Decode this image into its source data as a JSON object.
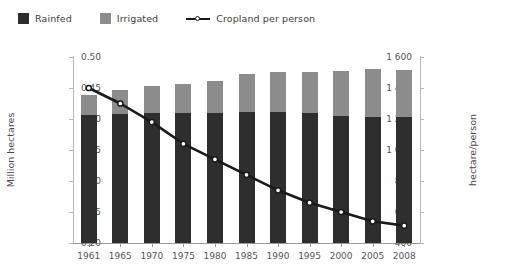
{
  "legend": {
    "items": [
      {
        "label": "Rainfed",
        "marker": "square-swatch",
        "color": "#2e2e2e"
      },
      {
        "label": "Irrigated",
        "marker": "square-swatch",
        "color": "#8c8c8c"
      },
      {
        "label": "Cropland per person",
        "marker": "line-with-point",
        "color": "#1a1a1a"
      }
    ]
  },
  "chart_data": {
    "type": "bar",
    "title": "",
    "subtitle": "",
    "xlabel": "",
    "ylabel": "Million hectares",
    "y2label": "hectare/person",
    "categories": [
      "1961",
      "1965",
      "1970",
      "1975",
      "1980",
      "1985",
      "1990",
      "1995",
      "2000",
      "2005",
      "2008"
    ],
    "ylim": [
      400,
      1600
    ],
    "yticks": [
      "400",
      "600",
      "800",
      "1 000",
      "1 200",
      "1 400",
      "1 600"
    ],
    "ytick_values": [
      400,
      600,
      800,
      1000,
      1200,
      1400,
      1600
    ],
    "y2lim": [
      0.2,
      0.5
    ],
    "y2ticks": [
      "0.20",
      "0.25",
      "0.30",
      "0.35",
      "0.40",
      "0.45",
      "0.50"
    ],
    "y2tick_values": [
      0.2,
      0.25,
      0.3,
      0.35,
      0.4,
      0.45,
      0.5
    ],
    "grid": false,
    "stacked": true,
    "legend_position": "top-left",
    "series": [
      {
        "name": "Rainfed",
        "axis": "left",
        "type": "bar",
        "color": "#2e2e2e",
        "values": [
          1225,
          1235,
          1240,
          1240,
          1240,
          1245,
          1245,
          1240,
          1220,
          1215,
          1210
        ]
      },
      {
        "name": "Irrigated",
        "axis": "left",
        "type": "bar",
        "color": "#8c8c8c",
        "values": [
          130,
          150,
          175,
          185,
          205,
          245,
          260,
          265,
          290,
          310,
          305
        ]
      },
      {
        "name": "Cropland per person",
        "axis": "right",
        "type": "line",
        "color": "#1a1a1a",
        "values": [
          0.45,
          0.425,
          0.395,
          0.36,
          0.335,
          0.31,
          0.285,
          0.265,
          0.25,
          0.235,
          0.228
        ]
      }
    ],
    "totals": [
      1355,
      1385,
      1415,
      1425,
      1445,
      1490,
      1505,
      1505,
      1510,
      1525,
      1515
    ]
  }
}
